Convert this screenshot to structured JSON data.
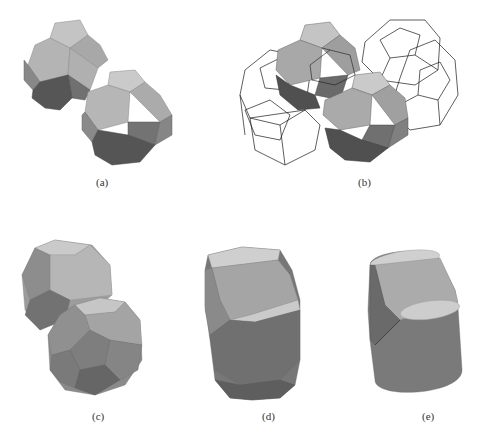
{
  "figure": {
    "panels": [
      {
        "id": "a",
        "label": "(a)",
        "description": "Two truncated octahedra joined (solid shaded)"
      },
      {
        "id": "b",
        "label": "(b)",
        "description": "Two solid truncated octahedra with surrounding wireframe neighbors"
      },
      {
        "id": "c",
        "label": "(c)",
        "description": "Two deformed polyhedral grains"
      },
      {
        "id": "d",
        "label": "(d)",
        "description": "Elongated polyhedral grain pair"
      },
      {
        "id": "e",
        "label": "(e)",
        "description": "Smooth cylindrical grain pair"
      }
    ]
  },
  "colors": {
    "light_face": "#b9b9b9",
    "mid_face": "#9b9b9b",
    "dark_square": "#707070",
    "bottom_face": "#555555",
    "top_cap": "#cdcdcd",
    "wire": "#1a1a1a"
  }
}
